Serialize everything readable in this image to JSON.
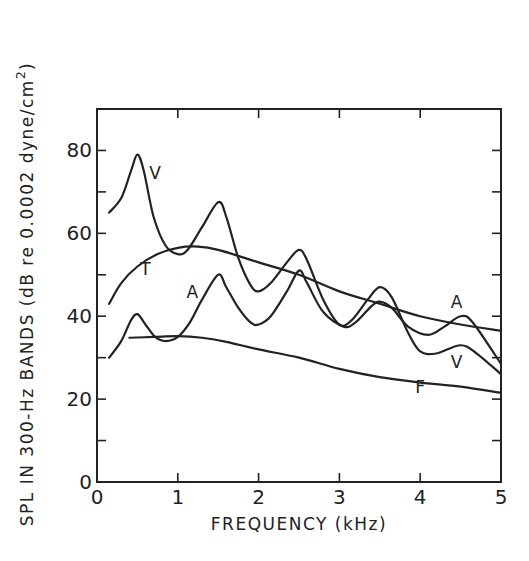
{
  "chart_data": {
    "type": "line",
    "title": "",
    "xlabel": "FREQUENCY (kHz)",
    "ylabel": "SPL IN 300-Hz BANDS (dB re 0.0002 dyne/cm²)",
    "ylabel_parts": {
      "main": "SPL IN 300-Hz BANDS (dB re 0.0002 dyne/cm",
      "sup": "2",
      "close": ")"
    },
    "xlim": [
      0,
      5
    ],
    "ylim": [
      0,
      90
    ],
    "xticks": [
      0,
      1,
      2,
      3,
      4,
      5
    ],
    "xtick_labels": [
      "0",
      "1",
      "2",
      "3",
      "4",
      "5"
    ],
    "yticks_major": [
      0,
      20,
      40,
      60,
      80
    ],
    "ytick_labels": [
      "0",
      "20",
      "40",
      "60",
      "80"
    ],
    "yticks_minor": [
      10,
      30,
      50,
      70
    ],
    "grid": false,
    "legend": "inline curve labels",
    "series": [
      {
        "name": "V",
        "label_pos": [
          0.72,
          73
        ],
        "label2_pos": [
          4.45,
          27.5
        ],
        "x": [
          0.15,
          0.3,
          0.42,
          0.5,
          0.58,
          0.7,
          0.85,
          1.0,
          1.12,
          1.3,
          1.5,
          1.6,
          1.75,
          1.9,
          2.0,
          2.15,
          2.35,
          2.5,
          2.6,
          2.8,
          3.0,
          3.15,
          3.35,
          3.5,
          3.65,
          3.85,
          4.0,
          4.2,
          4.5,
          4.7,
          5.0
        ],
        "values": [
          65,
          68.5,
          75,
          79,
          75,
          64,
          57,
          55,
          56,
          61.5,
          67.5,
          64,
          54,
          47.5,
          46,
          48,
          53,
          56,
          53.5,
          44,
          38,
          39,
          44,
          47,
          44.5,
          36,
          31.5,
          31,
          33,
          31,
          26
        ]
      },
      {
        "name": "A",
        "label_pos": [
          1.18,
          44.5
        ],
        "label2_pos": [
          4.45,
          42
        ],
        "x": [
          0.15,
          0.3,
          0.42,
          0.5,
          0.6,
          0.72,
          0.85,
          1.0,
          1.15,
          1.3,
          1.5,
          1.6,
          1.75,
          1.9,
          2.0,
          2.15,
          2.35,
          2.5,
          2.6,
          2.8,
          3.05,
          3.2,
          3.4,
          3.5,
          3.65,
          3.85,
          4.1,
          4.3,
          4.5,
          4.65,
          5.0
        ],
        "values": [
          30,
          34,
          39,
          40.5,
          38,
          35,
          34,
          35,
          38.5,
          44,
          50,
          47,
          42,
          38.5,
          38,
          40,
          46,
          51,
          48,
          41,
          37.5,
          38.5,
          42.5,
          43.5,
          42,
          37.5,
          35.5,
          37.5,
          40,
          38.5,
          28.5
        ]
      },
      {
        "name": "T",
        "label_pos": [
          0.6,
          50
        ],
        "x": [
          0.15,
          0.3,
          0.5,
          0.75,
          1.0,
          1.25,
          1.5,
          2.0,
          2.5,
          3.0,
          3.5,
          4.0,
          4.5,
          5.0
        ],
        "values": [
          43,
          48,
          52,
          55,
          56.5,
          56.8,
          56,
          53,
          50,
          46,
          43,
          40,
          38,
          36.5
        ]
      },
      {
        "name": "F",
        "label_pos": [
          4.0,
          21.5
        ],
        "x": [
          0.4,
          0.7,
          1.0,
          1.3,
          1.6,
          2.0,
          2.5,
          3.0,
          3.5,
          4.0,
          4.5,
          5.0
        ],
        "values": [
          34.8,
          35,
          35.2,
          34.8,
          33.8,
          32,
          30,
          27.3,
          25.3,
          24,
          23,
          21.5
        ]
      }
    ]
  },
  "style": {
    "line_color": "#222222",
    "background": "#ffffff"
  }
}
